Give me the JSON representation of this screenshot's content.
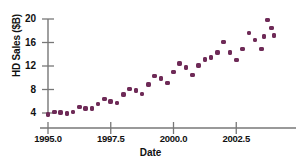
{
  "chart_data": {
    "type": "scatter",
    "title": "",
    "xlabel": "Date",
    "ylabel": "HD Sales ($B)",
    "xlim": [
      1994.7,
      2004.3
    ],
    "ylim": [
      2.6,
      20.8
    ],
    "xticks": [
      1995.0,
      1997.5,
      2000.0,
      2002.5
    ],
    "xtick_labels": [
      "1995.0",
      "1997.5",
      "2000.0",
      "2002.5"
    ],
    "yticks": [
      4,
      8,
      12,
      16,
      20
    ],
    "ytick_labels": [
      "4",
      "8",
      "12",
      "16",
      "20"
    ],
    "grid": false,
    "legend": null,
    "marker_color": "#6e2a57",
    "axis_color": "#777777",
    "x": [
      1995.0,
      1995.25,
      1995.5,
      1995.75,
      1996.0,
      1996.25,
      1996.5,
      1996.75,
      1997.0,
      1997.25,
      1997.5,
      1997.75,
      1998.0,
      1998.25,
      1998.5,
      1998.75,
      1999.0,
      1999.25,
      1999.5,
      1999.75,
      2000.0,
      2000.25,
      2000.5,
      2000.75,
      2001.0,
      2001.25,
      2001.5,
      2001.75,
      2002.0,
      2002.25,
      2002.5,
      2002.75,
      2003.0,
      2003.25,
      2003.5,
      2003.75,
      2004.0
    ],
    "y": [
      3.7,
      4.2,
      4.1,
      3.9,
      4.2,
      5.0,
      4.8,
      4.8,
      5.5,
      6.4,
      6.0,
      5.7,
      7.1,
      8.1,
      7.8,
      7.2,
      8.9,
      10.3,
      9.9,
      9.1,
      11.0,
      12.4,
      11.7,
      10.5,
      12.1,
      13.1,
      13.4,
      14.3,
      16.1,
      14.3,
      13.0,
      14.9,
      17.6,
      16.4,
      14.9,
      19.8,
      17.2
    ],
    "series": [
      {
        "name": "HD Sales",
        "x": [
          1995.0,
          1995.25,
          1995.5,
          1995.75,
          1996.0,
          1996.25,
          1996.5,
          1996.75,
          1997.0,
          1997.25,
          1997.5,
          1997.75,
          1998.0,
          1998.25,
          1998.5,
          1998.75,
          1999.0,
          1999.25,
          1999.5,
          1999.75,
          2000.0,
          2000.25,
          2000.5,
          2000.75,
          2001.0,
          2001.25,
          2001.5,
          2001.75,
          2002.0,
          2002.25,
          2002.5,
          2002.75,
          2003.0,
          2003.25,
          2003.5,
          2003.75,
          2004.0
        ],
        "values": [
          3.7,
          4.2,
          4.1,
          3.9,
          4.2,
          5.0,
          4.8,
          4.8,
          5.5,
          6.4,
          6.0,
          5.7,
          7.1,
          8.1,
          7.8,
          7.2,
          8.9,
          10.3,
          9.9,
          9.1,
          11.0,
          12.4,
          11.7,
          10.5,
          12.1,
          13.1,
          13.4,
          14.3,
          16.1,
          14.3,
          13.0,
          14.9,
          17.6,
          16.4,
          14.9,
          19.8,
          17.2
        ]
      }
    ]
  },
  "extra_points": {
    "right_cluster": [
      {
        "x": 2003.9,
        "y": 18.5
      },
      {
        "x": 2003.6,
        "y": 17.0
      }
    ]
  }
}
